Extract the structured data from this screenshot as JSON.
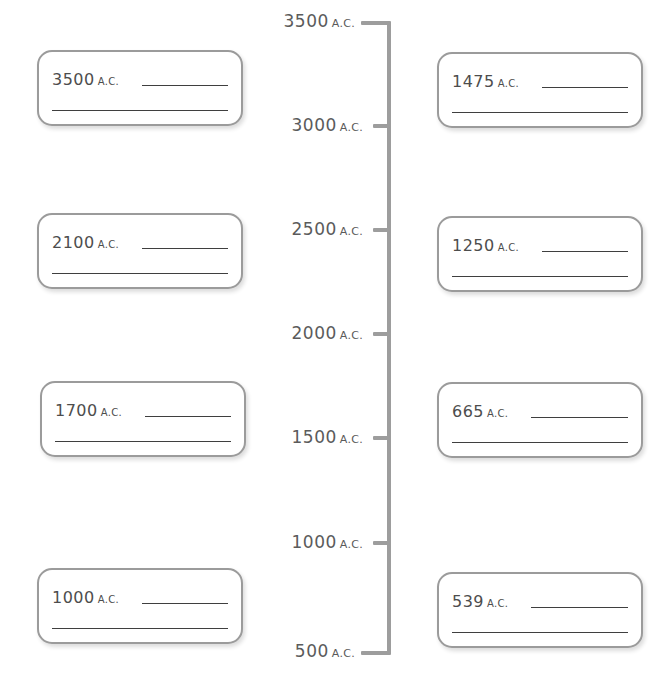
{
  "worksheet": {
    "title": "Timeline worksheet",
    "era_suffix": "A.C.",
    "axis": {
      "orientation": "vertical",
      "top_value": "3500",
      "bottom_value": "500",
      "ticks": [
        {
          "num": "3500",
          "era": "A.C."
        },
        {
          "num": "3000",
          "era": "A.C."
        },
        {
          "num": "2500",
          "era": "A.C."
        },
        {
          "num": "2000",
          "era": "A.C."
        },
        {
          "num": "1500",
          "era": "A.C."
        },
        {
          "num": "1000",
          "era": "A.C."
        },
        {
          "num": "500",
          "era": "A.C."
        }
      ]
    },
    "left_boxes": [
      {
        "num": "3500",
        "era": "A.C.",
        "answer": ""
      },
      {
        "num": "2100",
        "era": "A.C.",
        "answer": ""
      },
      {
        "num": "1700",
        "era": "A.C.",
        "answer": ""
      },
      {
        "num": "1000",
        "era": "A.C.",
        "answer": ""
      }
    ],
    "right_boxes": [
      {
        "num": "1475",
        "era": "A.C.",
        "answer": ""
      },
      {
        "num": "1250",
        "era": "A.C.",
        "answer": ""
      },
      {
        "num": "665",
        "era": "A.C.",
        "answer": ""
      },
      {
        "num": "539",
        "era": "A.C.",
        "answer": ""
      }
    ],
    "colors": {
      "box_border": "#9b9b9b",
      "axis": "#9d9d9d",
      "text": "#4d4d4d",
      "write_line": "#3f3f3f",
      "background": "#ffffff"
    }
  }
}
